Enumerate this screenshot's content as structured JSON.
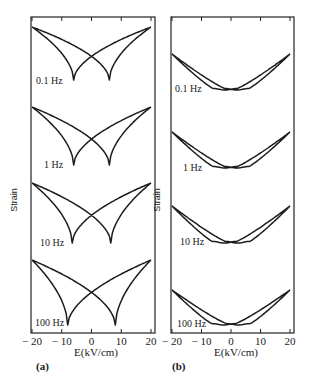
{
  "chart_data": [
    {
      "type": "line",
      "panel_label": "(a)",
      "title": "",
      "xlabel": "E(kV/cm)",
      "ylabel": "Strain",
      "xlim": [
        -20,
        20
      ],
      "xticks": [
        -20,
        -10,
        0,
        10,
        20
      ],
      "xtick_labels": [
        "-20",
        "-10",
        "0",
        "10",
        "20"
      ],
      "grid": false,
      "legend": "none (inline frequency labels)",
      "series": [
        {
          "name": "0.1 Hz",
          "shape": "butterfly",
          "coercive_field_kVcm": 6,
          "E_max": 20,
          "relative_strain_at_Emax": 1.0
        },
        {
          "name": "1 Hz",
          "shape": "butterfly",
          "coercive_field_kVcm": 6,
          "E_max": 20,
          "relative_strain_at_Emax": 1.0
        },
        {
          "name": "10 Hz",
          "shape": "butterfly",
          "coercive_field_kVcm": 6.5,
          "E_max": 20,
          "relative_strain_at_Emax": 1.0
        },
        {
          "name": "100 Hz",
          "shape": "butterfly",
          "coercive_field_kVcm": 8,
          "E_max": 20,
          "relative_strain_at_Emax": 1.0
        }
      ]
    },
    {
      "type": "line",
      "panel_label": "(b)",
      "title": "",
      "xlabel": "E(kV/cm)",
      "ylabel": "Strain",
      "xlim": [
        -20,
        20
      ],
      "xticks": [
        -20,
        -10,
        0,
        10,
        20
      ],
      "xtick_labels": [
        "-20",
        "-10",
        "0",
        "10",
        "20"
      ],
      "grid": false,
      "legend": "none (inline frequency labels)",
      "series": [
        {
          "name": "0.1 Hz",
          "shape": "flat-bottom hysteresis",
          "coercive_field_kVcm": 4,
          "E_max": 20,
          "relative_strain_at_Emax": 1.0
        },
        {
          "name": "1 Hz",
          "shape": "flat-bottom hysteresis",
          "coercive_field_kVcm": 4,
          "E_max": 20,
          "relative_strain_at_Emax": 1.0
        },
        {
          "name": "10 Hz",
          "shape": "flat-bottom hysteresis",
          "coercive_field_kVcm": 4.5,
          "E_max": 20,
          "relative_strain_at_Emax": 1.0
        },
        {
          "name": "100 Hz",
          "shape": "flat-bottom hysteresis",
          "coercive_field_kVcm": 5,
          "E_max": 20,
          "relative_strain_at_Emax": 1.0
        }
      ]
    }
  ],
  "figure": {
    "panel_a_label": "(a)",
    "panel_b_label": "(b)",
    "x_axis_label": "E(kV/cm)",
    "y_axis_label": "Strain",
    "tick_labels": [
      "-20",
      "-10",
      "0",
      "10",
      "20"
    ],
    "frequencies": [
      "0.1 Hz",
      "1 Hz",
      "10 Hz",
      "100 Hz"
    ]
  }
}
